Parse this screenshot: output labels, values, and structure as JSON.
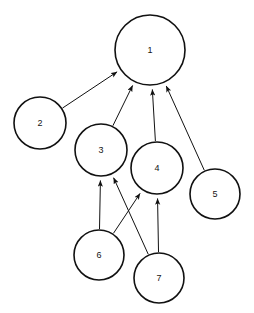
{
  "diagram": {
    "background_color": "#ffffff",
    "node_stroke_color": "#111111",
    "node_fill_color": "#ffffff",
    "edge_color": "#111111",
    "label_color": "#141414",
    "width": 254,
    "height": 313
  },
  "nodes": [
    {
      "id": "1",
      "label": "1",
      "cx": 150,
      "cy": 50,
      "r": 35
    },
    {
      "id": "2",
      "label": "2",
      "cx": 40,
      "cy": 123,
      "r": 26
    },
    {
      "id": "3",
      "label": "3",
      "cx": 101,
      "cy": 150,
      "r": 26
    },
    {
      "id": "4",
      "label": "4",
      "cx": 157,
      "cy": 168,
      "r": 26
    },
    {
      "id": "5",
      "label": "5",
      "cx": 215,
      "cy": 194,
      "r": 25
    },
    {
      "id": "6",
      "label": "6",
      "cx": 99,
      "cy": 255,
      "r": 25
    },
    {
      "id": "7",
      "label": "7",
      "cx": 159,
      "cy": 278,
      "r": 25
    }
  ],
  "edges": [
    {
      "from": "2",
      "to": "1",
      "directed": true
    },
    {
      "from": "3",
      "to": "1",
      "directed": true
    },
    {
      "from": "4",
      "to": "1",
      "directed": true
    },
    {
      "from": "5",
      "to": "1",
      "directed": true
    },
    {
      "from": "6",
      "to": "3",
      "directed": true
    },
    {
      "from": "6",
      "to": "4",
      "directed": true
    },
    {
      "from": "7",
      "to": "3",
      "directed": true
    },
    {
      "from": "7",
      "to": "4",
      "directed": true
    }
  ]
}
